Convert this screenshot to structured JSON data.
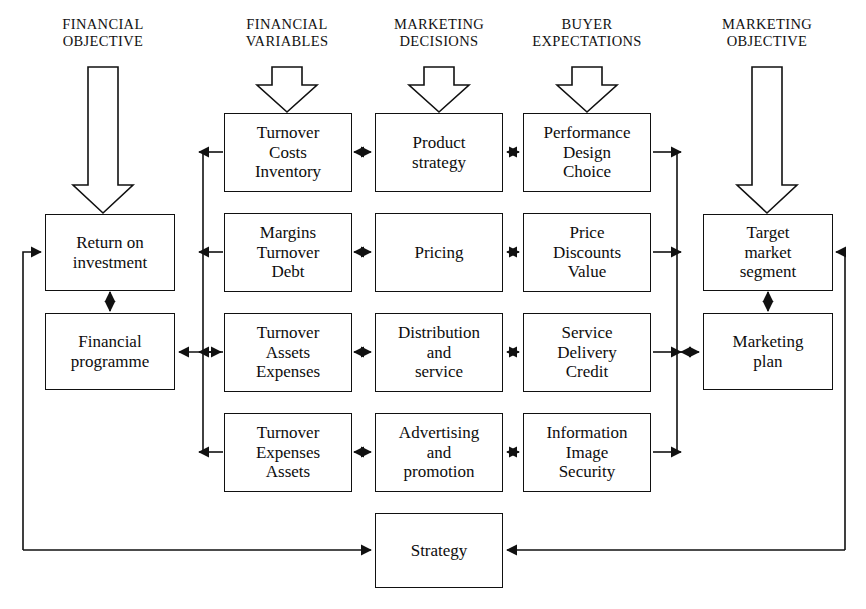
{
  "diagram": {
    "background_color": "#ffffff",
    "line_color": "#111111",
    "columns": [
      {
        "id": "financial-objective",
        "label": "FINANCIAL\nOBJECTIVE"
      },
      {
        "id": "financial-variables",
        "label": "FINANCIAL\nVARIABLES"
      },
      {
        "id": "marketing-decisions",
        "label": "MARKETING\nDECISIONS"
      },
      {
        "id": "buyer-expectations",
        "label": "BUYER\nEXPECTATIONS"
      },
      {
        "id": "marketing-objective",
        "label": "MARKETING\nOBJECTIVE"
      }
    ],
    "nodes": {
      "return_on_investment": "Return on\ninvestment",
      "financial_programme": "Financial\nprogramme",
      "fv_row1": "Turnover\nCosts\nInventory",
      "fv_row2": "Margins\nTurnover\nDebt",
      "fv_row3": "Turnover\nAssets\nExpenses",
      "fv_row4": "Turnover\nExpenses\nAssets",
      "md_row1": "Product\nstrategy",
      "md_row2": "Pricing",
      "md_row3": "Distribution\nand\nservice",
      "md_row4": "Advertising\nand\npromotion",
      "be_row1": "Performance\nDesign\nChoice",
      "be_row2": "Price\nDiscounts\nValue",
      "be_row3": "Service\nDelivery\nCredit",
      "be_row4": "Information\nImage\nSecurity",
      "target_market_segment": "Target\nmarket\nsegment",
      "marketing_plan": "Marketing\nplan",
      "strategy": "Strategy"
    }
  }
}
